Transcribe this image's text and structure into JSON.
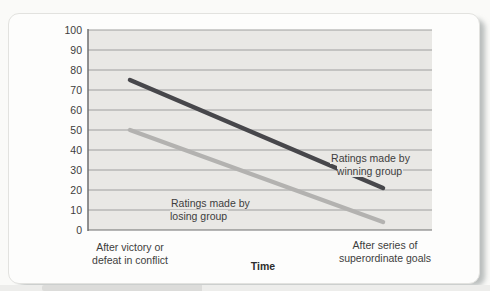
{
  "chart_data": {
    "type": "line",
    "title": "",
    "xlabel": "Time",
    "ylabel": "",
    "categories": [
      "After victory or\ndefeat in conflict",
      "After series of\nsuperordinate goals"
    ],
    "ylim": [
      0,
      100
    ],
    "ytick_step": 10,
    "grid": "horizontal",
    "legend_position": "inline-annotations",
    "series": [
      {
        "name": "Ratings made by\nwinning group",
        "values": [
          75,
          21
        ],
        "color": "#47474b"
      },
      {
        "name": "Ratings made by\nlosing group",
        "values": [
          50,
          4
        ],
        "color": "#b3b2b0"
      }
    ]
  },
  "colors": {
    "plot_bg": "#e9e8e5",
    "gridline": "#9e9e9e",
    "axis": "#6e6e6e",
    "text": "#3d3d3d",
    "card_bg": "#fdfdfc",
    "card_border": "#e2e2df",
    "shadow": "#9aa0a0"
  }
}
